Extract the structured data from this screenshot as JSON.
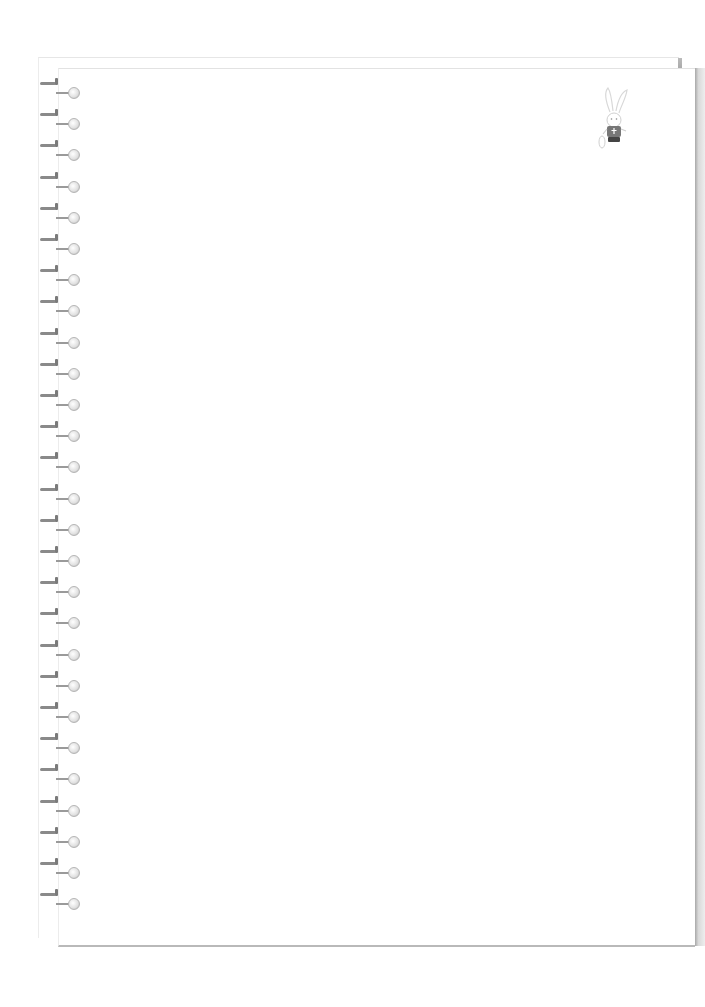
{
  "scene": {
    "type": "spiral-binder-notebook",
    "background_color": "#ffffff",
    "page_color": "#ffffff",
    "edge_shadow_color": "#9a9a9a"
  },
  "binder": {
    "ring_count": 27,
    "ring_start_y": 82,
    "ring_spacing": 31.2,
    "icon": "binder-ring-icon"
  },
  "mascot": {
    "icon": "bunny-mascot-icon",
    "shirt_color": "#777777",
    "pants_color": "#444444"
  }
}
